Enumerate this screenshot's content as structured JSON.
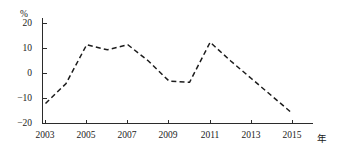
{
  "chart_data": {
    "type": "line",
    "title": "",
    "subtitle": "",
    "xlabel": "年",
    "ylabel": "%",
    "x": [
      2003,
      2004,
      2005,
      2006,
      2007,
      2008,
      2009,
      2010,
      2011,
      2012,
      2013,
      2014,
      2015
    ],
    "values": [
      -12,
      -4,
      11.5,
      9.5,
      11.5,
      5,
      -3,
      -3.5,
      12.5,
      5,
      -2,
      -9,
      -16
    ],
    "series": [
      {
        "name": "",
        "values": [
          -12,
          -4,
          11.5,
          9.5,
          11.5,
          5,
          -3,
          -3.5,
          12.5,
          5,
          -2,
          -9,
          -16
        ]
      }
    ],
    "xlim": [
      2003,
      2015
    ],
    "ylim": [
      -20,
      20
    ],
    "xticks": [
      2003,
      2005,
      2007,
      2009,
      2011,
      2013,
      2015
    ],
    "xtick_labels": [
      "2003",
      "2005",
      "2007",
      "2009",
      "2011",
      "2013",
      "2015"
    ],
    "yticks": [
      -20,
      -10,
      0,
      10,
      20
    ],
    "ytick_labels": [
      "−20",
      "−10",
      "0",
      "10",
      "20"
    ],
    "grid": false,
    "legend": false,
    "legend_position": "none",
    "line_style": "dashed",
    "line_color": "#1c1c1c",
    "axis_color": "#2b2b2b",
    "background_color": "#ffffff"
  },
  "axes": {
    "y_unit_label": "%",
    "x_unit_label": "年"
  }
}
